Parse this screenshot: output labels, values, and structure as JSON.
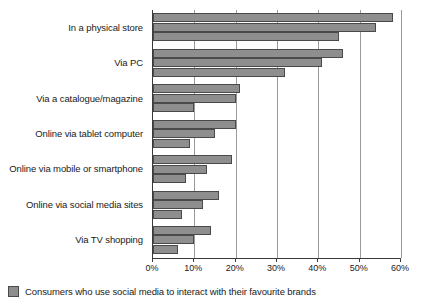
{
  "chart_data": {
    "type": "bar",
    "orientation": "horizontal",
    "title": "",
    "subtitle": "",
    "xlabel": "",
    "ylabel": "",
    "xlim": [
      0,
      60
    ],
    "xticks": [
      0,
      10,
      20,
      30,
      40,
      50,
      60
    ],
    "xticklabels": [
      "0%",
      "10%",
      "20%",
      "30%",
      "40%",
      "50%",
      "60%"
    ],
    "grid": true,
    "legend_position": "bottom-left",
    "categories": [
      "In a physical store",
      "Via PC",
      "Via a catalogue/magazine",
      "Online via tablet computer",
      "Online via mobile or smartphone",
      "Online via social media sites",
      "Via TV shopping"
    ],
    "series": [
      {
        "name": "Series 1",
        "values": [
          58,
          46,
          21,
          20,
          19,
          16,
          14
        ]
      },
      {
        "name": "Series 2",
        "values": [
          54,
          41,
          20,
          15,
          13,
          12,
          10
        ]
      },
      {
        "name": "Series 3",
        "values": [
          45,
          32,
          10,
          9,
          8,
          7,
          6
        ]
      }
    ],
    "legend": [
      "Consumers who use social media to interact with their favourite brands"
    ],
    "colors": {
      "bar_fill": "#8e8e8e",
      "bar_border": "#4a4a4a",
      "gridline": "#9a9a9a",
      "axis": "#3a3a3a",
      "text": "#1a1a1a",
      "background": "#ffffff"
    }
  }
}
